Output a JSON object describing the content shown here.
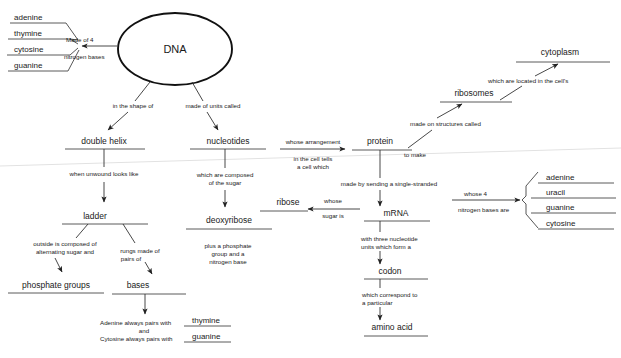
{
  "diagram": {
    "type": "concept-map",
    "colors": {
      "background": "#ffffff",
      "text": "#1a1a1a",
      "rule": "#5a5a5a",
      "connector": "#333333",
      "ellipse_stroke": "#111111"
    }
  },
  "nodes": {
    "dna": "DNA",
    "double_helix": "double helix",
    "nucleotides": "nucleotides",
    "ladder": "ladder",
    "deoxyribose": "deoxyribose",
    "phosphate_groups": "phosphate groups",
    "bases": "bases",
    "protein": "protein",
    "ribosomes": "ribosomes",
    "cytoplasm": "cytoplasm",
    "ribose": "ribose",
    "mrna": "mRNA",
    "codon": "codon",
    "amino_acid": "amino acid"
  },
  "dna_bases_list": {
    "items": [
      "adenine",
      "thymine",
      "cytosine",
      "guanine"
    ]
  },
  "mrna_bases_list": {
    "items": [
      "adenine",
      "uracil",
      "guanine",
      "cytosine"
    ]
  },
  "base_pairing": {
    "line1_prefix": "Adenine always pairs with",
    "line1_value": "thymine",
    "joiner": "and",
    "line2_prefix": "Cytosine always pairs with",
    "line2_value": "guanine"
  },
  "links": {
    "made_of_4": "Made of 4",
    "nitrogen_bases": "nitrogen bases",
    "in_the_shape_of": "in the shape of",
    "made_of_units_called": "made of units called",
    "when_unwound_looks_like": "when unwound looks like",
    "which_are_composed_1": "which are composed",
    "which_are_composed_2": "of the sugar",
    "plus_phosphate_1": "plus a phosphate",
    "plus_phosphate_2": "group and a",
    "plus_phosphate_3": "nitrogen base",
    "outside_composed_1": "outside is composed of",
    "outside_composed_2": "alternating sugar and",
    "rungs_made_1": "rungs made of",
    "rungs_made_2": "pairs of",
    "whose_arrangement": "whose arrangement",
    "in_the_cell_tells_1": "in the cell tells",
    "in_the_cell_tells_2": "a cell which",
    "to_make": "to make",
    "made_on_structures_called": "made on structures called",
    "which_are_located": "which are located in the cell's",
    "made_by_sending": "made by sending a single-stranded",
    "whose": "whose",
    "sugar_is": "sugar is",
    "with_three_1": "with three nucleotide",
    "with_three_2": "units which form a",
    "which_correspond_1": "which correspond to",
    "which_correspond_2": "a particular",
    "whose_4": "whose 4",
    "nitrogen_bases_are": "nitrogen bases are"
  }
}
